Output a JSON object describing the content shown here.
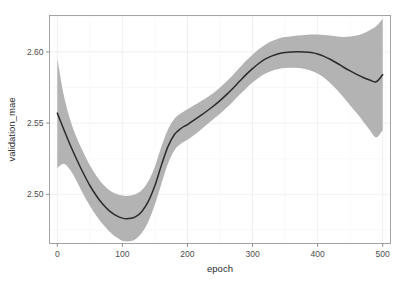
{
  "chart_data": {
    "type": "line",
    "title": "",
    "subtitle": "",
    "xlabel": "epoch",
    "ylabel": "validation_mae",
    "xlim": [
      -12,
      512
    ],
    "ylim": [
      2.4655,
      2.6255
    ],
    "xticks": [
      0,
      100,
      200,
      300,
      400,
      500
    ],
    "xtick_labels": [
      "0",
      "100",
      "200",
      "300",
      "400",
      "500"
    ],
    "yticks": [
      2.5,
      2.55,
      2.6
    ],
    "ytick_labels": [
      "2.50",
      "2.55",
      "2.60"
    ],
    "x_minor_ticks": [
      50,
      150,
      250,
      350,
      450
    ],
    "y_minor_ticks": [
      2.475,
      2.525,
      2.575,
      2.625
    ],
    "grid": true,
    "legend": false,
    "legend_position": "none",
    "background": "#ffffff",
    "panel_border_color": "#9a9a9a",
    "gridline_color": "#ececec",
    "line_color": "#2b2b2b",
    "ribbon_color": "#b3b3b3",
    "ribbon_opacity": 1,
    "annotations": [],
    "series": [
      {
        "name": "smoothed validation_mae",
        "style": "loess-smooth-with-se-ribbon",
        "x": [
          0,
          10,
          20,
          30,
          40,
          50,
          60,
          70,
          80,
          90,
          100,
          110,
          120,
          130,
          140,
          150,
          160,
          170,
          180,
          190,
          200,
          210,
          220,
          230,
          240,
          250,
          260,
          270,
          280,
          290,
          300,
          310,
          320,
          330,
          340,
          350,
          360,
          370,
          380,
          390,
          400,
          410,
          420,
          430,
          440,
          450,
          460,
          470,
          480,
          490,
          500
        ],
        "values": [
          2.557,
          2.5455,
          2.5345,
          2.5243,
          2.5148,
          2.5062,
          2.499,
          2.493,
          2.4884,
          2.4852,
          2.4833,
          2.483,
          2.4842,
          2.488,
          2.4952,
          2.5062,
          2.5205,
          2.5335,
          2.542,
          2.5462,
          2.549,
          2.552,
          2.5552,
          2.5585,
          2.562,
          2.5658,
          2.57,
          2.5745,
          2.5793,
          2.584,
          2.5882,
          2.592,
          2.595,
          2.5972,
          2.5987,
          2.5995,
          2.5999,
          2.6,
          2.5999,
          2.5995,
          2.5985,
          2.5968,
          2.5946,
          2.592,
          2.5892,
          2.5866,
          2.5842,
          2.582,
          2.5802,
          2.579,
          2.584
        ],
        "ci_lower": [
          2.5185,
          2.5215,
          2.517,
          2.509,
          2.5,
          2.492,
          2.485,
          2.479,
          2.474,
          2.47,
          2.4675,
          2.467,
          2.4685,
          2.473,
          2.481,
          2.4928,
          2.5075,
          2.5215,
          2.531,
          2.5355,
          2.5383,
          2.5415,
          2.5452,
          2.549,
          2.5528,
          2.5566,
          2.5608,
          2.5652,
          2.5698,
          2.5743,
          2.5784,
          2.582,
          2.5848,
          2.5868,
          2.588,
          2.5886,
          2.5888,
          2.5886,
          2.588,
          2.5868,
          2.5848,
          2.5818,
          2.5778,
          2.5732,
          2.568,
          2.5625,
          2.557,
          2.5512,
          2.5452,
          2.54,
          2.545
        ],
        "ci_upper": [
          2.5955,
          2.5695,
          2.552,
          2.5396,
          2.5296,
          2.5204,
          2.513,
          2.507,
          2.5028,
          2.5004,
          2.4991,
          2.499,
          2.5,
          2.503,
          2.5094,
          2.5196,
          2.5335,
          2.5455,
          2.553,
          2.5569,
          2.5597,
          2.5625,
          2.5652,
          2.568,
          2.5712,
          2.575,
          2.5792,
          2.5838,
          2.5888,
          2.5937,
          2.598,
          2.602,
          2.6052,
          2.6076,
          2.6094,
          2.6104,
          2.611,
          2.6114,
          2.6118,
          2.6122,
          2.6122,
          2.6118,
          2.6114,
          2.6108,
          2.6104,
          2.6107,
          2.6114,
          2.6128,
          2.6152,
          2.618,
          2.623
        ]
      }
    ]
  }
}
